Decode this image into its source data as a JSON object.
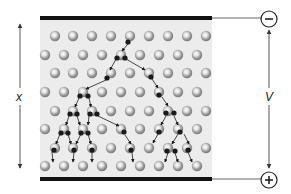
{
  "labels": {
    "thickness": "x",
    "voltage": "V",
    "cathode_sign": "−",
    "anode_sign": "+"
  },
  "colors": {
    "panel": "#ececec",
    "electrode": "#111111",
    "atom_outer": "#8c8c8c",
    "atom_inner": "#d9d9d9",
    "electron": "#1a1a1a",
    "line": "#555555"
  },
  "grid": {
    "rows_y": [
      36,
      55,
      73,
      92,
      111,
      129,
      148,
      166
    ],
    "even_row_x": [
      55,
      73,
      92,
      111,
      130,
      149,
      168,
      187,
      206
    ],
    "odd_row_x": [
      45,
      64,
      83,
      102,
      121,
      140,
      159,
      178,
      197
    ]
  },
  "cascade": {
    "arrows": [
      [
        128,
        44,
        122,
        51
      ],
      [
        116,
        59,
        110,
        70
      ],
      [
        126,
        59,
        145,
        70
      ],
      [
        106,
        80,
        86,
        89
      ],
      [
        152,
        79,
        158,
        88
      ],
      [
        79,
        98,
        75,
        107
      ],
      [
        89,
        98,
        91,
        107
      ],
      [
        162,
        97,
        168,
        106
      ],
      [
        69,
        116,
        66,
        125
      ],
      [
        77,
        116,
        80,
        125
      ],
      [
        89,
        116,
        88,
        125
      ],
      [
        98,
        116,
        119,
        126
      ],
      [
        166,
        116,
        161,
        125
      ],
      [
        174,
        116,
        178,
        125
      ],
      [
        60,
        134,
        56,
        144
      ],
      [
        68,
        134,
        71,
        144
      ],
      [
        81,
        134,
        76,
        144
      ],
      [
        88,
        134,
        91,
        144
      ],
      [
        125,
        135,
        131,
        144
      ],
      [
        158,
        134,
        153,
        143
      ],
      [
        178,
        134,
        172,
        144
      ],
      [
        184,
        134,
        189,
        144
      ],
      [
        52,
        152,
        53,
        162
      ],
      [
        74,
        152,
        73,
        162
      ],
      [
        92,
        152,
        92,
        162
      ],
      [
        132,
        152,
        133,
        162
      ],
      [
        168,
        153,
        165,
        162
      ],
      [
        175,
        153,
        178,
        162
      ],
      [
        188,
        152,
        192,
        162
      ]
    ],
    "electrons": [
      [
        128,
        42
      ],
      [
        117,
        58
      ],
      [
        125,
        58
      ],
      [
        107,
        78
      ],
      [
        151,
        77
      ],
      [
        80,
        96
      ],
      [
        88,
        96
      ],
      [
        159,
        95
      ],
      [
        70,
        114
      ],
      [
        77,
        114
      ],
      [
        90,
        114
      ],
      [
        97,
        114
      ],
      [
        166,
        113
      ],
      [
        174,
        113
      ],
      [
        61,
        133
      ],
      [
        68,
        133
      ],
      [
        81,
        133
      ],
      [
        88,
        133
      ],
      [
        124,
        132
      ],
      [
        159,
        132
      ],
      [
        180,
        132
      ],
      [
        54,
        150
      ],
      [
        74,
        150
      ],
      [
        92,
        150
      ],
      [
        131,
        150
      ],
      [
        167,
        151
      ],
      [
        175,
        151
      ],
      [
        188,
        150
      ]
    ]
  }
}
